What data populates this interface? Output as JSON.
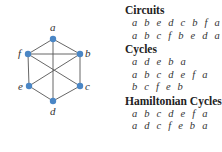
{
  "graph": {
    "vertices": [
      {
        "id": "a",
        "x": 53,
        "y": 39,
        "lx": 50,
        "ly": 31
      },
      {
        "id": "b",
        "x": 80,
        "y": 54,
        "lx": 85,
        "ly": 57
      },
      {
        "id": "c",
        "x": 80,
        "y": 86,
        "lx": 85,
        "ly": 90
      },
      {
        "id": "d",
        "x": 53,
        "y": 101,
        "lx": 50,
        "ly": 115
      },
      {
        "id": "e",
        "x": 29,
        "y": 86,
        "lx": 18,
        "ly": 90
      },
      {
        "id": "f",
        "x": 28,
        "y": 54,
        "lx": 18,
        "ly": 57
      }
    ],
    "edges": [
      [
        "a",
        "b"
      ],
      [
        "a",
        "f"
      ],
      [
        "f",
        "b"
      ],
      [
        "b",
        "c"
      ],
      [
        "c",
        "d"
      ],
      [
        "d",
        "e"
      ],
      [
        "e",
        "f"
      ],
      [
        "a",
        "d"
      ],
      [
        "f",
        "c"
      ],
      [
        "e",
        "b"
      ]
    ],
    "vertex_color": "#4a86c5",
    "edge_color": "#555555"
  },
  "sections": [
    {
      "title": "Circuits",
      "items": [
        "a b e d c b f a",
        "a b c f b e d a"
      ]
    },
    {
      "title": "Cycles",
      "items": [
        "a d e b a",
        "a b c d e f a",
        "b c f e b"
      ]
    },
    {
      "title": "Hamiltonian Cycles",
      "items": [
        "a b c d e f a",
        "a d c f e b a"
      ]
    }
  ]
}
